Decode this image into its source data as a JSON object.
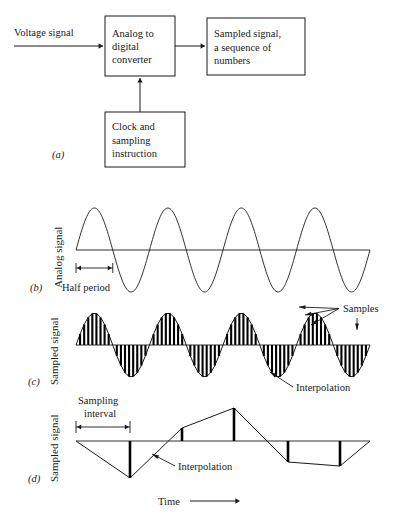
{
  "figure": {
    "panels": [
      {
        "id": "(a)",
        "type": "block-diagram",
        "boxes": [
          {
            "name": "adc",
            "lines": [
              "Analog to",
              "digital",
              "converter"
            ],
            "x": 105,
            "y": 16,
            "w": 70,
            "h": 60
          },
          {
            "name": "sampled-output",
            "lines": [
              "Sampled  signal,",
              "a sequence of",
              "numbers"
            ],
            "x": 207,
            "y": 18,
            "w": 98,
            "h": 57
          },
          {
            "name": "clock",
            "lines": [
              "Clock and",
              "sampling",
              "instruction"
            ],
            "x": 105,
            "y": 112,
            "w": 80,
            "h": 55
          }
        ],
        "input_label": "Voltage signal",
        "arrows": [
          {
            "name": "input-arrow",
            "x1": 14,
            "y1": 46,
            "x2": 103,
            "y2": 46
          },
          {
            "name": "adc-to-output-arrow",
            "x1": 175,
            "y1": 46,
            "x2": 205,
            "y2": 46
          },
          {
            "name": "clock-to-adc-arrow",
            "x1": 140,
            "y1": 112,
            "x2": 140,
            "y2": 78
          }
        ]
      },
      {
        "id": "(b)",
        "type": "analog-sine",
        "axis_label": "Analog signal",
        "annotation": "Half period",
        "baseline_y": 250,
        "x_start": 76,
        "x_end": 370,
        "amplitude": 42,
        "cycles": 4,
        "half_period_px": 36.75
      },
      {
        "id": "(c)",
        "type": "sampled-sine",
        "axis_label": "Sampled signal",
        "annotations": [
          "Samples",
          "Interpolation"
        ],
        "baseline_y": 345,
        "x_start": 76,
        "x_end": 370,
        "amplitude": 32,
        "cycles": 4,
        "sample_count": 72,
        "bar_width": 2.1
      },
      {
        "id": "(d)",
        "type": "sampled-sparse",
        "axis_label": "Sampled signal",
        "annotations": [
          "Sampling",
          "interval",
          "Interpolation"
        ],
        "time_label": "Time",
        "baseline_y": 441,
        "x_start": 76,
        "x_end": 370,
        "sampling_interval_px": 54,
        "samples": [
          {
            "x": 76,
            "y": 441
          },
          {
            "x": 130,
            "y": 478
          },
          {
            "x": 182,
            "y": 428
          },
          {
            "x": 234,
            "y": 408
          },
          {
            "x": 288,
            "y": 462
          },
          {
            "x": 340,
            "y": 466
          },
          {
            "x": 370,
            "y": 441
          }
        ]
      }
    ]
  },
  "colors": {
    "ink": "#1a1a1a",
    "paper": "#ffffff"
  }
}
